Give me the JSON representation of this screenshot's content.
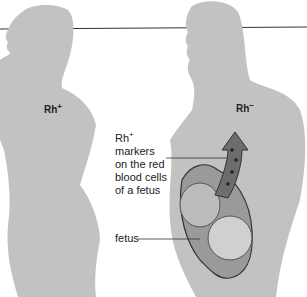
{
  "diagram": {
    "colors": {
      "silhouette": "#c2c2c2",
      "line": "#333333",
      "uterus": "#9a9a9a",
      "arrow": "#6d6d6d"
    },
    "father": {
      "label": "Rh",
      "sign": "+"
    },
    "mother": {
      "label": "Rh",
      "sign": "−"
    },
    "annotation": {
      "line1_main": "Rh",
      "line1_sup": "+",
      "line2": "markers",
      "line3": "on the red",
      "line4": "blood cells",
      "line5": "of a fetus"
    },
    "fetus_label": "fetus"
  }
}
